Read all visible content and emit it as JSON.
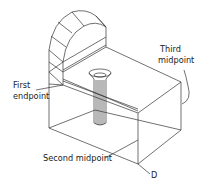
{
  "diagram": {
    "labels": {
      "first_endpoint_line1": "First",
      "first_endpoint_line2": "endpoint",
      "third_midpoint_line1": "Third",
      "third_midpoint_line2": "midpoint",
      "second_midpoint": "Second midpoint",
      "point_d": "D"
    },
    "colors": {
      "line": "#333333",
      "text": "#222222",
      "background": "#ffffff"
    }
  }
}
